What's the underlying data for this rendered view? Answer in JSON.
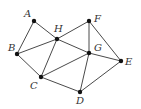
{
  "graph": {
    "vertices": [
      {
        "id": "A",
        "label": "A",
        "x": 34,
        "y": 21,
        "lx": 24,
        "ly": 17
      },
      {
        "id": "H",
        "label": "H",
        "x": 57,
        "y": 39,
        "lx": 54,
        "ly": 32
      },
      {
        "id": "F",
        "label": "F",
        "x": 89,
        "y": 21,
        "lx": 94,
        "ly": 22
      },
      {
        "id": "B",
        "label": "B",
        "x": 17,
        "y": 54,
        "lx": 8,
        "ly": 51
      },
      {
        "id": "G",
        "label": "G",
        "x": 89,
        "y": 53,
        "lx": 94,
        "ly": 51
      },
      {
        "id": "E",
        "label": "E",
        "x": 121,
        "y": 61,
        "lx": 125,
        "ly": 65
      },
      {
        "id": "C",
        "label": "C",
        "x": 41,
        "y": 77,
        "lx": 30,
        "ly": 89
      },
      {
        "id": "D",
        "label": "D",
        "x": 80,
        "y": 92,
        "lx": 76,
        "ly": 104
      }
    ],
    "edges": [
      [
        "A",
        "B"
      ],
      [
        "A",
        "H"
      ],
      [
        "B",
        "H"
      ],
      [
        "B",
        "C"
      ],
      [
        "H",
        "C"
      ],
      [
        "H",
        "F"
      ],
      [
        "H",
        "G"
      ],
      [
        "F",
        "G"
      ],
      [
        "F",
        "E"
      ],
      [
        "G",
        "E"
      ],
      [
        "G",
        "C"
      ],
      [
        "G",
        "D"
      ],
      [
        "C",
        "D"
      ],
      [
        "D",
        "E"
      ]
    ]
  }
}
